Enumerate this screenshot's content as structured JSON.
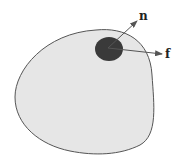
{
  "diagram": {
    "body": {
      "fill": "#e6e6e6",
      "stroke": "#555555"
    },
    "patch": {
      "fill": "#3a3a3a"
    },
    "vectors": [
      {
        "name": "normal",
        "label": "n"
      },
      {
        "name": "force",
        "label": "f"
      }
    ],
    "arrow_color": "#555555"
  }
}
